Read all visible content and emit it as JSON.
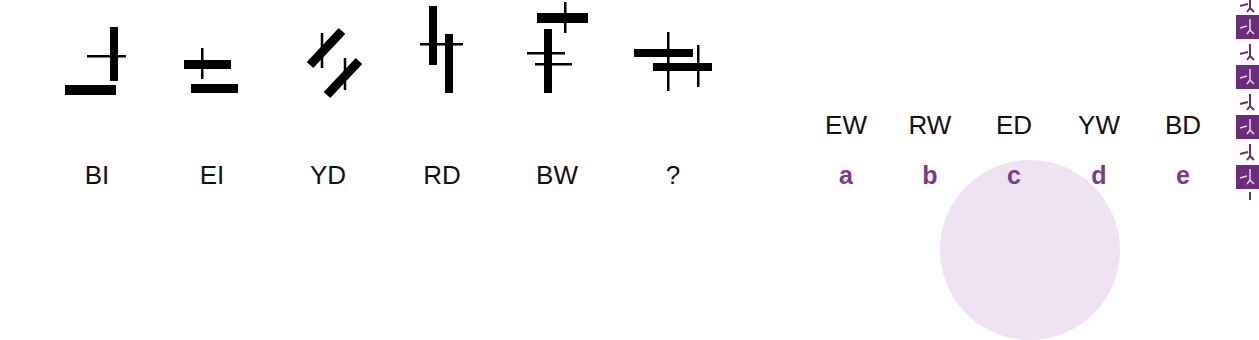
{
  "puzzle": {
    "figures": [
      {
        "id": "fig-1",
        "label": "BI"
      },
      {
        "id": "fig-2",
        "label": "EI"
      },
      {
        "id": "fig-3",
        "label": "YD"
      },
      {
        "id": "fig-4",
        "label": "RD"
      },
      {
        "id": "fig-5",
        "label": "BW"
      },
      {
        "id": "fig-6",
        "label": "?"
      }
    ],
    "options": [
      {
        "code": "EW",
        "letter": "a"
      },
      {
        "code": "RW",
        "letter": "b"
      },
      {
        "code": "ED",
        "letter": "c"
      },
      {
        "code": "YW",
        "letter": "d"
      },
      {
        "code": "BD",
        "letter": "e"
      }
    ]
  },
  "colors": {
    "shape": "#000000",
    "label_text": "#111111",
    "option_letter": "#7a3b86",
    "accent_purple": "#6b2c7b",
    "background_circle": "#efe2f3"
  },
  "decor": {
    "strip_icon": "figure-motif-icon"
  }
}
